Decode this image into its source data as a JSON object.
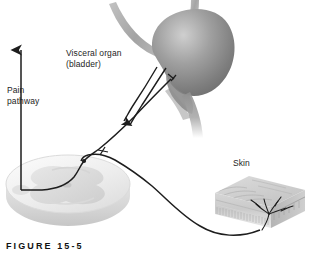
{
  "figure": {
    "caption": "FIGURE 15-5",
    "background_color": "#ffffff",
    "ink_color": "#1d1d1d"
  },
  "labels": {
    "visceral_organ": "Visceral organ\n(bladder)",
    "pain_pathway": "Pain\npathway",
    "skin": "Skin"
  },
  "structures": {
    "bladder": {
      "name": "bladder",
      "fill_light": "#c9c9c9",
      "fill_mid": "#8d8d8d",
      "fill_dark": "#6a6a6a"
    },
    "ureter": {
      "name": "ureter",
      "fill": "#a8a8a8"
    },
    "urethra": {
      "name": "urethra",
      "fill": "#9a9a9a"
    },
    "spinal_cord": {
      "name": "spinal-cord-cross-section",
      "white_matter": "#efefef",
      "gray_matter": "#d8d8d8",
      "edge": "#cfcfcf"
    },
    "skin_block": {
      "name": "skin-block",
      "top_face": "#d2d2d2",
      "front_face": "#cccccc",
      "side_face": "#b9b9b9"
    }
  },
  "pathways": {
    "visceral_afferent": "visceral-afferent-nerve",
    "somatic_afferent": "somatic-afferent-nerve",
    "ascending_pain_tract": "ascending-pain-tract-arrow",
    "referred_direction_arrow": "referred-pain-direction-arrow",
    "free_nerve_endings": "free-nerve-endings"
  }
}
